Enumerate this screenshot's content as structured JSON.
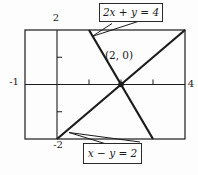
{
  "figure": {
    "ink_color": "#1b1b1b",
    "background": "#fdfdfd",
    "labels": {
      "y_max": "2",
      "x_min": "-1",
      "x_max": "4",
      "y_min": "-2",
      "intersection_point": "(2, 0)",
      "equation_top": "2x + y = 4",
      "equation_bottom": "x − y = 2"
    }
  },
  "chart_data": {
    "type": "line",
    "title": "",
    "xlabel": "",
    "ylabel": "",
    "xlim": [
      -1,
      4
    ],
    "ylim": [
      -2,
      2
    ],
    "x_ticks": [
      1,
      2,
      3
    ],
    "y_ticks": [
      -1,
      1
    ],
    "axis_edge_labels": {
      "x_min": "-1",
      "x_max": "4",
      "y_min": "-2",
      "y_max": "2"
    },
    "grid": false,
    "legend_position": "none",
    "series": [
      {
        "name": "2x + y = 4",
        "points": [
          [
            1,
            2
          ],
          [
            3,
            -2
          ]
        ]
      },
      {
        "name": "x − y = 2",
        "points": [
          [
            0,
            -2
          ],
          [
            4,
            2
          ]
        ]
      }
    ],
    "intersection": {
      "x": 2,
      "y": 0,
      "label": "(2, 0)"
    },
    "annotations": [
      {
        "text": "2x + y = 4",
        "boxed": true,
        "position": "top",
        "points_to": "line 2x+y=4"
      },
      {
        "text": "x − y = 2",
        "boxed": true,
        "position": "bottom",
        "points_to": "line x−y=2"
      }
    ]
  }
}
